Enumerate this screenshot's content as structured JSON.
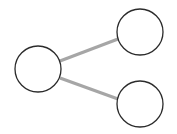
{
  "diagram": {
    "type": "graph",
    "width": 177,
    "height": 134,
    "colors": {
      "background": "#ffffff",
      "node_stroke": "#2b2b2b",
      "node_fill": "#ffffff",
      "edge": "#a6a6a6"
    },
    "nodes": [
      {
        "id": "left",
        "cx": 38,
        "cy": 69,
        "r": 23
      },
      {
        "id": "top-right",
        "cx": 140,
        "cy": 32,
        "r": 23
      },
      {
        "id": "bottom-right",
        "cx": 140,
        "cy": 104,
        "r": 23
      }
    ],
    "edges": [
      {
        "from": "left",
        "to": "top-right",
        "x1": 60,
        "y1": 61,
        "x2": 118,
        "y2": 39
      },
      {
        "from": "left",
        "to": "bottom-right",
        "x1": 60,
        "y1": 78,
        "x2": 118,
        "y2": 99
      }
    ]
  }
}
